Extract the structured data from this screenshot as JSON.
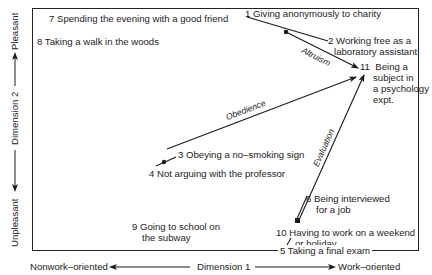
{
  "figure": {
    "x_axis": {
      "label": "Dimension 1",
      "left_end": "Nonwork–oriented",
      "right_end": "Work–oriented"
    },
    "y_axis": {
      "label": "Dimension 2",
      "top_end": "Pleasant",
      "bottom_end": "Unpleasant"
    },
    "items": [
      {
        "id": "1",
        "text": "Giving anonymously to charity"
      },
      {
        "id": "2",
        "line1": "Working free as a",
        "line2": "laboratory assistant"
      },
      {
        "id": "3",
        "text": "Obeying a no–smoking sign"
      },
      {
        "id": "4",
        "text": "Not arguing with the professor"
      },
      {
        "id": "5",
        "text": "Taking a final exam"
      },
      {
        "id": "6",
        "line1": "Being interviewed",
        "line2": "for a job"
      },
      {
        "id": "7",
        "text": "Spending the evening with a good friend"
      },
      {
        "id": "8",
        "text": "Taking a walk in the woods"
      },
      {
        "id": "9",
        "line1": "Going to school on",
        "line2": "the subway"
      },
      {
        "id": "10",
        "line1": "Having to work on a weekend",
        "line2": "or holiday"
      },
      {
        "id": "11",
        "line1": "Being a",
        "line2": "subject in",
        "line3": "a psychology",
        "line4": "expt."
      }
    ],
    "vectors": [
      {
        "name": "Altruism",
        "from": "1/2",
        "to": "11"
      },
      {
        "name": "Obedience",
        "from": "3/4",
        "to": "11"
      },
      {
        "name": "Evaluation",
        "from": "10/6",
        "to": "11"
      }
    ]
  }
}
